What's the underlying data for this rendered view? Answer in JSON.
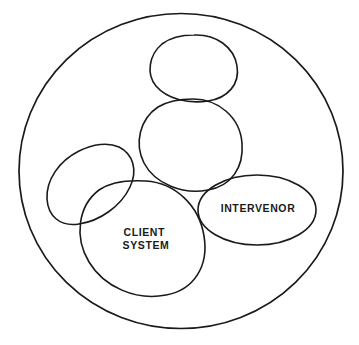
{
  "diagram": {
    "type": "venn-blob-diagram",
    "background_color": "#ffffff",
    "stroke_color": "#1a1a1a",
    "outer_boundary": {
      "name": "environment-boundary",
      "shape": "circle",
      "cx": 181,
      "cy": 171,
      "rx": 162,
      "ry": 158,
      "label": ""
    },
    "blobs": [
      {
        "id": "blob-top",
        "name": "top-system-blob",
        "label": "",
        "shape": "rounded-blob",
        "cx": 194,
        "cy": 68,
        "rx": 42,
        "ry": 33
      },
      {
        "id": "blob-middle",
        "name": "middle-system-blob",
        "label": "",
        "shape": "rounded-blob",
        "cx": 191,
        "cy": 145,
        "rx": 51,
        "ry": 46
      },
      {
        "id": "blob-left",
        "name": "left-system-blob",
        "label": "",
        "shape": "tilted-ellipse",
        "cx": 93,
        "cy": 183,
        "rx": 48,
        "ry": 34,
        "rotation": -24
      },
      {
        "id": "blob-client-system",
        "name": "client-system-blob",
        "label": "CLIENT SYSTEM",
        "label_lines": [
          "CLIENT",
          "SYSTEM"
        ],
        "shape": "rounded-blob",
        "cx": 143,
        "cy": 238,
        "rx": 62,
        "ry": 58
      },
      {
        "id": "blob-intervenor",
        "name": "intervenor-blob",
        "label": "INTERVENOR",
        "label_lines": [
          "INTERVENOR"
        ],
        "shape": "ellipse",
        "cx": 257,
        "cy": 210,
        "rx": 59,
        "ry": 35
      }
    ],
    "labels": [
      {
        "name": "client-system-label",
        "line1": "CLIENT",
        "line2": "SYSTEM",
        "x": 146,
        "y": 233
      },
      {
        "name": "intervenor-label",
        "line1": "INTERVENOR",
        "x": 258,
        "y": 209
      }
    ]
  }
}
